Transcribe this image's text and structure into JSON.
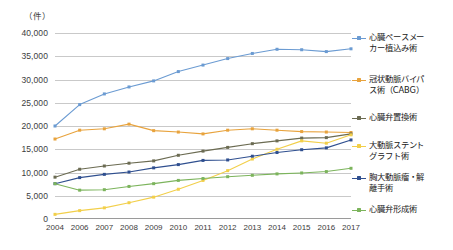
{
  "chart_data": {
    "type": "line",
    "title": "",
    "unit_label": "（件）",
    "xlabel": "",
    "ylabel": "",
    "ylim": [
      0,
      40000
    ],
    "ytick_step": 5000,
    "ytick_labels": [
      "40,000",
      "35,000",
      "30,000",
      "25,000",
      "20,000",
      "15,000",
      "10,000",
      "5,000",
      "0"
    ],
    "grid": true,
    "legend_position": "right",
    "categories": [
      "2004",
      "2006",
      "2007",
      "2008",
      "2009",
      "2010",
      "2011",
      "2012",
      "2013",
      "2014",
      "2015",
      "2016",
      "2017"
    ],
    "series": [
      {
        "name": "心臓ペースメーカー植込み術",
        "legend_label": "心臓ペースメー\nカー植込み術",
        "color": "#6b9bd2",
        "values": [
          20000,
          24600,
          26900,
          28400,
          29700,
          31700,
          33100,
          34500,
          35600,
          36500,
          36400,
          36000,
          36600
        ]
      },
      {
        "name": "冠状動脈バイパス術（CABG）",
        "legend_label": "冠状動脈バイパ\nス術（CABG）",
        "color": "#e8a33d",
        "values": [
          17200,
          19100,
          19400,
          20400,
          19000,
          18700,
          18300,
          19100,
          19400,
          19100,
          18800,
          18700,
          18600
        ]
      },
      {
        "name": "心臓弁置換術",
        "legend_label": "心臓弁置換術",
        "color": "#6b6b52",
        "values": [
          9000,
          10700,
          11400,
          12000,
          12500,
          13700,
          14600,
          15400,
          16200,
          16800,
          17400,
          17500,
          18300
        ]
      },
      {
        "name": "大動脈ステントグラフト術",
        "legend_label": "大動脈ステント\nグラフト術",
        "color": "#f2cf4a",
        "values": [
          1000,
          1800,
          2400,
          3500,
          4700,
          6400,
          8300,
          10400,
          12900,
          15000,
          16800,
          16300,
          18100
        ]
      },
      {
        "name": "胸大動脈瘤・解離手術",
        "legend_label": "胸大動脈瘤・解\n離手術",
        "color": "#2f4f8f",
        "values": [
          7600,
          8900,
          9600,
          10100,
          11000,
          11700,
          12600,
          12700,
          13500,
          14300,
          14900,
          15300,
          17000
        ]
      },
      {
        "name": "心臓弁形成術",
        "legend_label": "心臓弁形成術",
        "color": "#7cb45c",
        "values": [
          7600,
          6200,
          6300,
          7000,
          7600,
          8300,
          8700,
          9100,
          9400,
          9700,
          9900,
          10200,
          10900
        ]
      }
    ]
  }
}
